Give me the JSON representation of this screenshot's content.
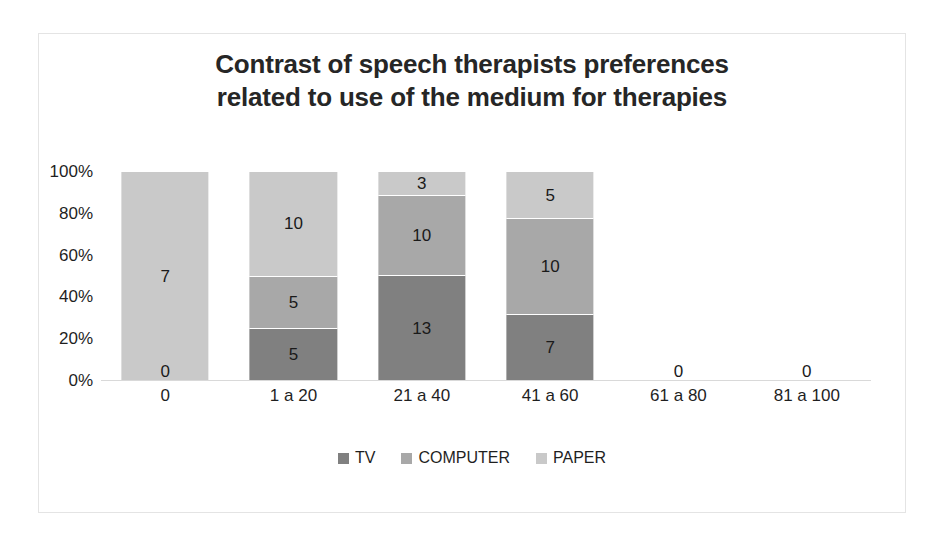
{
  "chart_data": {
    "type": "bar",
    "stacked": true,
    "normalized": "100%",
    "title": "Contrast of speech therapists preferences related to use of the medium for therapies",
    "title_lines": [
      "Contrast of speech therapists preferences",
      "related to use of the medium for therapies"
    ],
    "xlabel": "",
    "ylabel": "",
    "ylim": [
      0,
      100
    ],
    "yticks": [
      "0%",
      "20%",
      "40%",
      "60%",
      "80%",
      "100%"
    ],
    "ytick_values": [
      0,
      20,
      40,
      60,
      80,
      100
    ],
    "grid": false,
    "legend_position": "bottom",
    "categories": [
      "0",
      "1 a 20",
      "21 a 40",
      "41 a 60",
      "61 a 80",
      "81 a 100"
    ],
    "series": [
      {
        "name": "TV",
        "color": "#808080",
        "values": [
          0,
          5,
          13,
          7,
          0,
          0
        ]
      },
      {
        "name": "COMPUTER",
        "color": "#a8a8a8",
        "values": [
          0,
          5,
          10,
          10,
          0,
          0
        ]
      },
      {
        "name": "PAPER",
        "color": "#c9c9c9",
        "values": [
          7,
          10,
          3,
          5,
          0,
          0
        ]
      }
    ],
    "column_totals": [
      7,
      20,
      26,
      22,
      0,
      0
    ],
    "bar_labels": [
      {
        "category": "0",
        "segments": [
          {
            "series": "PAPER",
            "label": "7",
            "percent": 100
          },
          {
            "series": "TV",
            "label": "0",
            "percent": 0
          }
        ]
      },
      {
        "category": "1 a 20",
        "segments": [
          {
            "series": "PAPER",
            "label": "10",
            "percent": 50
          },
          {
            "series": "COMPUTER",
            "label": "5",
            "percent": 25
          },
          {
            "series": "TV",
            "label": "5",
            "percent": 25
          }
        ]
      },
      {
        "category": "21 a 40",
        "segments": [
          {
            "series": "PAPER",
            "label": "3",
            "percent": 11.5
          },
          {
            "series": "COMPUTER",
            "label": "10",
            "percent": 38.5
          },
          {
            "series": "TV",
            "label": "13",
            "percent": 50
          }
        ]
      },
      {
        "category": "41 a 60",
        "segments": [
          {
            "series": "PAPER",
            "label": "5",
            "percent": 22.7
          },
          {
            "series": "COMPUTER",
            "label": "10",
            "percent": 45.5
          },
          {
            "series": "TV",
            "label": "7",
            "percent": 31.8
          }
        ]
      },
      {
        "category": "61 a 80",
        "segments": [
          {
            "series": "TV",
            "label": "0",
            "percent": 0
          }
        ]
      },
      {
        "category": "81 a 100",
        "segments": [
          {
            "series": "TV",
            "label": "0",
            "percent": 0
          }
        ]
      }
    ]
  },
  "axis": {
    "y_ticks": [
      {
        "label": "100%",
        "pos": 100
      },
      {
        "label": "80%",
        "pos": 80
      },
      {
        "label": "60%",
        "pos": 60
      },
      {
        "label": "40%",
        "pos": 40
      },
      {
        "label": "20%",
        "pos": 20
      },
      {
        "label": "0%",
        "pos": 0
      }
    ],
    "x_ticks": [
      "0",
      "1 a 20",
      "21 a 40",
      "41 a 60",
      "61 a 80",
      "81 a 100"
    ]
  },
  "legend": {
    "items": [
      {
        "label": "TV",
        "color": "#808080"
      },
      {
        "label": "COMPUTER",
        "color": "#a8a8a8"
      },
      {
        "label": "PAPER",
        "color": "#c9c9c9"
      }
    ]
  },
  "bars": [
    {
      "category": "0",
      "segments": [
        {
          "series": "PAPER",
          "value": "7",
          "percent": 100,
          "color": "#c9c9c9",
          "show_label": true
        }
      ],
      "zero_label": "0"
    },
    {
      "category": "1 a 20",
      "segments": [
        {
          "series": "PAPER",
          "value": "10",
          "percent": 50,
          "color": "#c9c9c9",
          "show_label": true
        },
        {
          "series": "COMPUTER",
          "value": "5",
          "percent": 25,
          "color": "#a8a8a8",
          "show_label": true
        },
        {
          "series": "TV",
          "value": "5",
          "percent": 25,
          "color": "#808080",
          "show_label": true
        }
      ],
      "zero_label": ""
    },
    {
      "category": "21 a 40",
      "segments": [
        {
          "series": "PAPER",
          "value": "3",
          "percent": 11.5,
          "color": "#c9c9c9",
          "show_label": true
        },
        {
          "series": "COMPUTER",
          "value": "10",
          "percent": 38.5,
          "color": "#a8a8a8",
          "show_label": true
        },
        {
          "series": "TV",
          "value": "13",
          "percent": 50.0,
          "color": "#808080",
          "show_label": true
        }
      ],
      "zero_label": ""
    },
    {
      "category": "41 a 60",
      "segments": [
        {
          "series": "PAPER",
          "value": "5",
          "percent": 22.7,
          "color": "#c9c9c9",
          "show_label": true
        },
        {
          "series": "COMPUTER",
          "value": "10",
          "percent": 45.5,
          "color": "#a8a8a8",
          "show_label": true
        },
        {
          "series": "TV",
          "value": "7",
          "percent": 31.8,
          "color": "#808080",
          "show_label": true
        }
      ],
      "zero_label": ""
    },
    {
      "category": "61 a 80",
      "segments": [],
      "zero_label": "0"
    },
    {
      "category": "81 a 100",
      "segments": [],
      "zero_label": "0"
    }
  ]
}
